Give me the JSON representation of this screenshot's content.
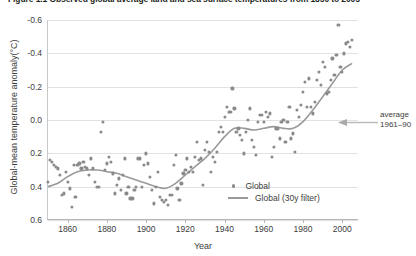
{
  "figure": {
    "title": "Figure 1.1  Observed global average land and sea surface temperatures from 1850 to 2005"
  },
  "annotation": {
    "line1": "average",
    "line2": "1961–90",
    "arrow_icon": "arrow-left-icon"
  },
  "legend": {
    "position": "inside-bottom-right",
    "items": [
      {
        "label": "Global",
        "marker": "dot"
      },
      {
        "label": "Global (30y filter)",
        "marker": "line"
      }
    ]
  },
  "axes": {
    "y_ticks": [
      "0.6",
      "0.4",
      "0.2",
      "0.0",
      "-0.2",
      "-0.4",
      "-0.6"
    ],
    "x_ticks": [
      "1860",
      "1880",
      "1900",
      "1920",
      "1940",
      "1960",
      "1980",
      "2000"
    ]
  },
  "colors": {
    "marker": "#8a8a8a",
    "line": "#9a9a9a",
    "grid": "#e2e2e2",
    "axis": "#b5b5b5",
    "text": "#3c3c3c"
  },
  "chart_data": {
    "type": "scatter",
    "title": "Figure 1.1  Observed global average land and sea surface temperatures from 1850 to 2005",
    "xlabel": "Year",
    "ylabel": "Global-mean temperature anomaly(°C)",
    "xlim": [
      1850,
      2008
    ],
    "ylim": [
      -0.6,
      0.6
    ],
    "xticks": [
      1860,
      1880,
      1900,
      1920,
      1940,
      1960,
      1980,
      2000
    ],
    "yticks": [
      -0.6,
      -0.4,
      -0.2,
      0.0,
      0.2,
      0.4,
      0.6
    ],
    "grid": true,
    "reference_line": {
      "value": 0.0,
      "label": "average 1961–90"
    },
    "series": [
      {
        "name": "Global",
        "type": "scatter",
        "marker": "circle",
        "color": "#8a8a8a",
        "x": [
          1850,
          1851,
          1852,
          1853,
          1854,
          1855,
          1856,
          1857,
          1858,
          1859,
          1860,
          1861,
          1862,
          1863,
          1864,
          1865,
          1866,
          1867,
          1868,
          1869,
          1870,
          1871,
          1872,
          1873,
          1874,
          1875,
          1876,
          1877,
          1878,
          1879,
          1880,
          1881,
          1882,
          1883,
          1884,
          1885,
          1886,
          1887,
          1888,
          1889,
          1890,
          1891,
          1892,
          1893,
          1894,
          1895,
          1896,
          1897,
          1898,
          1899,
          1900,
          1901,
          1902,
          1903,
          1904,
          1905,
          1906,
          1907,
          1908,
          1909,
          1910,
          1911,
          1912,
          1913,
          1914,
          1915,
          1916,
          1917,
          1918,
          1919,
          1920,
          1921,
          1922,
          1923,
          1924,
          1925,
          1926,
          1927,
          1928,
          1929,
          1930,
          1931,
          1932,
          1933,
          1934,
          1935,
          1936,
          1937,
          1938,
          1939,
          1940,
          1941,
          1942,
          1943,
          1944,
          1945,
          1946,
          1947,
          1948,
          1949,
          1950,
          1951,
          1952,
          1953,
          1954,
          1955,
          1956,
          1957,
          1958,
          1959,
          1960,
          1961,
          1962,
          1963,
          1964,
          1965,
          1966,
          1967,
          1968,
          1969,
          1970,
          1971,
          1972,
          1973,
          1974,
          1975,
          1976,
          1977,
          1978,
          1979,
          1980,
          1981,
          1982,
          1983,
          1984,
          1985,
          1986,
          1987,
          1988,
          1989,
          1990,
          1991,
          1992,
          1993,
          1994,
          1995,
          1996,
          1997,
          1998,
          1999,
          2000,
          2001,
          2002,
          2003,
          2004,
          2005
        ],
        "y": [
          -0.37,
          -0.24,
          -0.25,
          -0.27,
          -0.28,
          -0.29,
          -0.33,
          -0.45,
          -0.44,
          -0.31,
          -0.37,
          -0.41,
          -0.52,
          -0.27,
          -0.46,
          -0.27,
          -0.26,
          -0.29,
          -0.25,
          -0.28,
          -0.29,
          -0.33,
          -0.23,
          -0.29,
          -0.37,
          -0.4,
          -0.4,
          -0.07,
          -0.01,
          -0.3,
          -0.26,
          -0.22,
          -0.25,
          -0.32,
          -0.44,
          -0.39,
          -0.35,
          -0.42,
          -0.33,
          -0.23,
          -0.44,
          -0.4,
          -0.47,
          -0.47,
          -0.42,
          -0.4,
          -0.23,
          -0.23,
          -0.4,
          -0.27,
          -0.2,
          -0.26,
          -0.34,
          -0.42,
          -0.5,
          -0.4,
          -0.31,
          -0.46,
          -0.48,
          -0.49,
          -0.48,
          -0.51,
          -0.45,
          -0.45,
          -0.27,
          -0.21,
          -0.41,
          -0.48,
          -0.38,
          -0.32,
          -0.3,
          -0.23,
          -0.31,
          -0.28,
          -0.31,
          -0.22,
          -0.13,
          -0.24,
          -0.23,
          -0.39,
          -0.18,
          -0.13,
          -0.19,
          -0.31,
          -0.22,
          -0.25,
          -0.19,
          -0.07,
          -0.04,
          -0.07,
          0.02,
          0.08,
          0.05,
          0.05,
          0.19,
          0.07,
          -0.07,
          -0.05,
          -0.09,
          -0.12,
          -0.2,
          -0.07,
          0.0,
          0.07,
          -0.12,
          -0.16,
          -0.21,
          -0.01,
          0.03,
          0.03,
          -0.01,
          0.05,
          0.02,
          0.04,
          -0.22,
          -0.16,
          -0.05,
          -0.05,
          -0.11,
          -0.01,
          0.0,
          -0.13,
          -0.01,
          0.08,
          -0.11,
          -0.08,
          -0.19,
          0.06,
          0.02,
          0.09,
          0.17,
          0.23,
          0.08,
          0.25,
          0.08,
          0.04,
          0.11,
          0.24,
          0.29,
          0.21,
          0.35,
          0.32,
          0.16,
          0.17,
          0.24,
          0.37,
          0.27,
          0.39,
          0.57,
          0.32,
          0.29,
          0.4,
          0.46,
          0.47,
          0.44,
          0.48
        ]
      },
      {
        "name": "Global (30y filter)",
        "type": "line",
        "color": "#9a9a9a",
        "x": [
          1850,
          1855,
          1860,
          1865,
          1870,
          1875,
          1880,
          1885,
          1890,
          1895,
          1900,
          1905,
          1910,
          1915,
          1920,
          1925,
          1930,
          1935,
          1940,
          1945,
          1950,
          1955,
          1960,
          1965,
          1970,
          1975,
          1980,
          1985,
          1990,
          1995,
          2000,
          2005
        ],
        "y": [
          -0.4,
          -0.38,
          -0.34,
          -0.31,
          -0.3,
          -0.3,
          -0.31,
          -0.32,
          -0.34,
          -0.36,
          -0.38,
          -0.4,
          -0.41,
          -0.38,
          -0.33,
          -0.28,
          -0.23,
          -0.17,
          -0.1,
          -0.05,
          -0.05,
          -0.06,
          -0.05,
          -0.04,
          -0.05,
          -0.05,
          -0.01,
          0.06,
          0.14,
          0.22,
          0.3,
          0.34
        ]
      }
    ]
  }
}
